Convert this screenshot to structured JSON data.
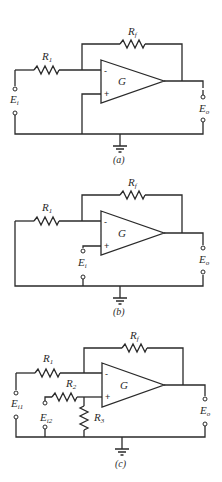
{
  "figure": {
    "circuits": [
      {
        "id": "a",
        "caption": "(a)",
        "title": "Inverting amplifier",
        "opamp_label": "G",
        "inputs": {
          "minus": "-",
          "plus": "+"
        },
        "resistors": [
          {
            "name": "R",
            "sub": "1"
          },
          {
            "name": "R",
            "sub": "f"
          }
        ],
        "terminals": [
          {
            "name": "E",
            "sub": "i"
          },
          {
            "name": "E",
            "sub": "o"
          }
        ]
      },
      {
        "id": "b",
        "caption": "(b)",
        "title": "Non-inverting amplifier",
        "opamp_label": "G",
        "inputs": {
          "minus": "-",
          "plus": "+"
        },
        "resistors": [
          {
            "name": "R",
            "sub": "1"
          },
          {
            "name": "R",
            "sub": "f"
          }
        ],
        "terminals": [
          {
            "name": "E",
            "sub": "i"
          },
          {
            "name": "E",
            "sub": "o"
          }
        ]
      },
      {
        "id": "c",
        "caption": "(c)",
        "title": "Differential amplifier",
        "opamp_label": "G",
        "inputs": {
          "minus": "-",
          "plus": "+"
        },
        "resistors": [
          {
            "name": "R",
            "sub": "1"
          },
          {
            "name": "R",
            "sub": "f"
          },
          {
            "name": "R",
            "sub": "2"
          },
          {
            "name": "R",
            "sub": "3"
          }
        ],
        "terminals": [
          {
            "name": "E",
            "sub": "i1"
          },
          {
            "name": "E",
            "sub": "i2"
          },
          {
            "name": "E",
            "sub": "o"
          }
        ]
      }
    ],
    "colors": {
      "ink": "#2a2a2a",
      "background": "#ffffff"
    }
  }
}
